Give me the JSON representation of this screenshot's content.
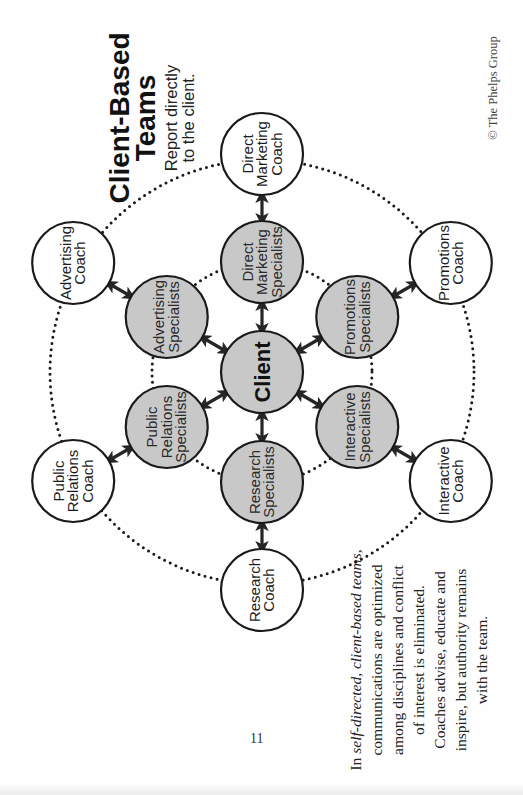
{
  "title": {
    "line1": "Client-Based",
    "line2": "Teams"
  },
  "subtitle": {
    "line1": "Report directly",
    "line2": "to the client."
  },
  "copyright": "© The Phelps Group",
  "page_number": "11",
  "client": {
    "label": "Client",
    "fill": "#c8c8c8"
  },
  "colors": {
    "specialist_fill": "#c8c8c8",
    "coach_fill": "#ffffff",
    "stroke": "#1a1a1a",
    "arrow": "#262626",
    "dots": "#1a1a1a"
  },
  "specialists": [
    {
      "id": "direct-marketing",
      "lines": [
        "Direct",
        "Marketing",
        "Specialists"
      ]
    },
    {
      "id": "promotions",
      "lines": [
        "Promotions",
        "Specialists"
      ]
    },
    {
      "id": "interactive",
      "lines": [
        "Interactive",
        "Specialists"
      ]
    },
    {
      "id": "research",
      "lines": [
        "Research",
        "Specialists"
      ]
    },
    {
      "id": "public-relations",
      "lines": [
        "Public",
        "Relations",
        "Specialists"
      ]
    },
    {
      "id": "advertising",
      "lines": [
        "Advertising",
        "Specialists"
      ]
    }
  ],
  "coaches": [
    {
      "id": "direct-marketing",
      "lines": [
        "Direct",
        "Marketing",
        "Coach"
      ]
    },
    {
      "id": "promotions",
      "lines": [
        "Promotions",
        "Coach"
      ]
    },
    {
      "id": "interactive",
      "lines": [
        "Interactive",
        "Coach"
      ]
    },
    {
      "id": "research",
      "lines": [
        "Research",
        "Coach"
      ]
    },
    {
      "id": "public-relations",
      "lines": [
        "Public",
        "Relations",
        "Coach"
      ]
    },
    {
      "id": "advertising",
      "lines": [
        "Advertising",
        "Coach"
      ]
    }
  ],
  "caption": {
    "lines": [
      {
        "segments": [
          {
            "text": "In ",
            "italic": false
          },
          {
            "text": "self-directed, client-based teams,",
            "italic": true
          }
        ]
      },
      {
        "segments": [
          {
            "text": "communications are optimized",
            "italic": false
          }
        ]
      },
      {
        "segments": [
          {
            "text": "among disciplines and conflict",
            "italic": false
          }
        ]
      },
      {
        "segments": [
          {
            "text": "of interest is eliminated.",
            "italic": false
          }
        ]
      },
      {
        "segments": [
          {
            "text": "Coaches advise, educate and",
            "italic": false
          }
        ]
      },
      {
        "segments": [
          {
            "text": "inspire, but authority remains",
            "italic": false
          }
        ]
      },
      {
        "segments": [
          {
            "text": "with the team.",
            "italic": false
          }
        ]
      }
    ]
  }
}
